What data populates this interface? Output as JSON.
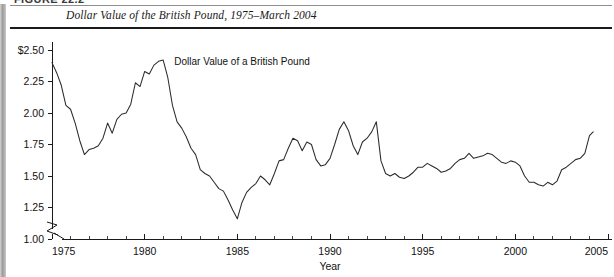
{
  "figure": {
    "clipped_caption": "FIGURE 22.2",
    "title": "Dollar Value of the British Pound, 1975–March 2004"
  },
  "chart_data": {
    "type": "line",
    "title": "Dollar Value of the British Pound, 1975–March 2004",
    "xlabel": "Year",
    "ylabel": "",
    "annotation": "Dollar Value of a British Pound",
    "legend_position": "inline-annotation",
    "grid": false,
    "axis_break_y": true,
    "axis_break_x": true,
    "xlim": [
      1975,
      2005
    ],
    "ylim": [
      1.0,
      2.5
    ],
    "x_tick_labels": [
      "1975",
      "1980",
      "1985",
      "1990",
      "1995",
      "2000",
      "2005"
    ],
    "x_ticks": [
      1975,
      1980,
      1985,
      1990,
      1995,
      2000,
      2005
    ],
    "x_minor_tick_step": 1,
    "y_tick_labels": [
      "$2.50",
      "2.25",
      "2.00",
      "1.75",
      "1.50",
      "1.25",
      "1.00"
    ],
    "y_ticks": [
      2.5,
      2.25,
      2.0,
      1.75,
      1.5,
      1.25,
      1.0
    ],
    "series": [
      {
        "name": "Dollar Value of a British Pound",
        "color": "#2b2b2b",
        "x": [
          1975.0,
          1975.25,
          1975.5,
          1975.75,
          1976.0,
          1976.25,
          1976.5,
          1976.75,
          1977.0,
          1977.25,
          1977.5,
          1977.75,
          1978.0,
          1978.25,
          1978.5,
          1978.75,
          1979.0,
          1979.25,
          1979.5,
          1979.75,
          1980.0,
          1980.25,
          1980.5,
          1980.75,
          1981.0,
          1981.25,
          1981.5,
          1981.75,
          1982.0,
          1982.25,
          1982.5,
          1982.75,
          1983.0,
          1983.25,
          1983.5,
          1983.75,
          1984.0,
          1984.25,
          1984.5,
          1984.75,
          1985.0,
          1985.25,
          1985.5,
          1985.75,
          1986.0,
          1986.25,
          1986.5,
          1986.75,
          1987.0,
          1987.25,
          1987.5,
          1987.75,
          1988.0,
          1988.25,
          1988.5,
          1988.75,
          1989.0,
          1989.25,
          1989.5,
          1989.75,
          1990.0,
          1990.25,
          1990.5,
          1990.75,
          1991.0,
          1991.25,
          1991.5,
          1991.75,
          1992.0,
          1992.25,
          1992.5,
          1992.75,
          1993.0,
          1993.25,
          1993.5,
          1993.75,
          1994.0,
          1994.25,
          1994.5,
          1994.75,
          1995.0,
          1995.25,
          1995.5,
          1995.75,
          1996.0,
          1996.25,
          1996.5,
          1996.75,
          1997.0,
          1997.25,
          1997.5,
          1997.75,
          1998.0,
          1998.25,
          1998.5,
          1998.75,
          1999.0,
          1999.25,
          1999.5,
          1999.75,
          2000.0,
          2000.25,
          2000.5,
          2000.75,
          2001.0,
          2001.25,
          2001.5,
          2001.75,
          2002.0,
          2002.25,
          2002.5,
          2002.75,
          2003.0,
          2003.25,
          2003.5,
          2003.75,
          2004.0,
          2004.2
        ],
        "values": [
          2.4,
          2.32,
          2.22,
          2.06,
          2.03,
          1.92,
          1.78,
          1.67,
          1.71,
          1.72,
          1.74,
          1.8,
          1.92,
          1.84,
          1.95,
          1.99,
          2.0,
          2.07,
          2.24,
          2.21,
          2.33,
          2.31,
          2.38,
          2.41,
          2.42,
          2.28,
          2.06,
          1.93,
          1.88,
          1.81,
          1.72,
          1.67,
          1.55,
          1.52,
          1.5,
          1.45,
          1.4,
          1.38,
          1.31,
          1.23,
          1.16,
          1.29,
          1.37,
          1.41,
          1.44,
          1.5,
          1.47,
          1.43,
          1.52,
          1.62,
          1.63,
          1.72,
          1.8,
          1.78,
          1.7,
          1.77,
          1.75,
          1.63,
          1.58,
          1.59,
          1.64,
          1.75,
          1.87,
          1.93,
          1.86,
          1.74,
          1.67,
          1.77,
          1.8,
          1.85,
          1.93,
          1.62,
          1.52,
          1.5,
          1.52,
          1.49,
          1.48,
          1.5,
          1.53,
          1.57,
          1.57,
          1.6,
          1.58,
          1.56,
          1.53,
          1.54,
          1.56,
          1.6,
          1.63,
          1.64,
          1.68,
          1.64,
          1.65,
          1.66,
          1.68,
          1.67,
          1.64,
          1.61,
          1.6,
          1.62,
          1.61,
          1.58,
          1.5,
          1.45,
          1.45,
          1.43,
          1.42,
          1.45,
          1.43,
          1.46,
          1.55,
          1.57,
          1.6,
          1.63,
          1.64,
          1.68,
          1.82,
          1.85
        ]
      }
    ]
  },
  "axis": {
    "x_title": "Year"
  }
}
